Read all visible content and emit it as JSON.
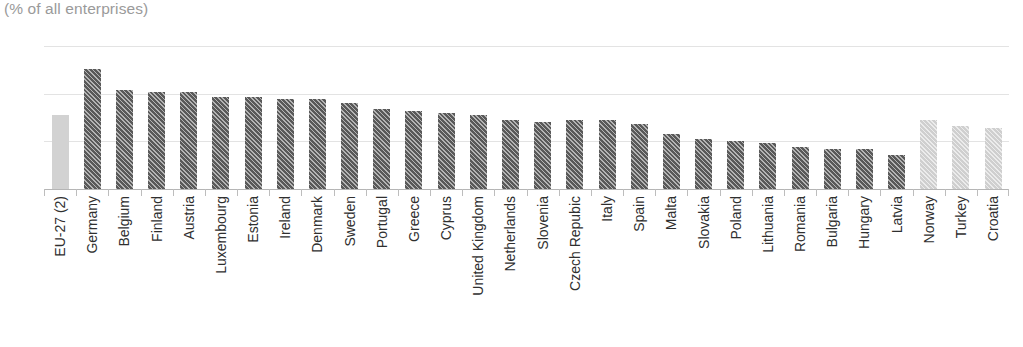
{
  "chart_data": {
    "type": "bar",
    "title": "",
    "subtitle": "(% of all enterprises)",
    "xlabel": "",
    "ylabel": "",
    "ylim": [
      0,
      75
    ],
    "yticks": [
      0,
      25,
      50,
      75
    ],
    "grid": true,
    "legend": "none",
    "categories": [
      "EU-27 (2)",
      "Germany",
      "Belgium",
      "Finland",
      "Austria",
      "Luxembourg",
      "Estonia",
      "Ireland",
      "Denmark",
      "Sweden",
      "Portugal",
      "Greece",
      "Cyprus",
      "United Kingdom",
      "Netherlands",
      "Slovenia",
      "Czech Repubic",
      "Italy",
      "Spain",
      "Malta",
      "Slovakia",
      "Poland",
      "Lithuania",
      "Romania",
      "Bulgaria",
      "Hungary",
      "Latvia",
      "Norway",
      "Turkey",
      "Croatia"
    ],
    "values": [
      39,
      63,
      52,
      51,
      51,
      48,
      48,
      47,
      47,
      45,
      42,
      41,
      40,
      39,
      36,
      35,
      36,
      36,
      34,
      29,
      26,
      25,
      24,
      22,
      21,
      21,
      18,
      36,
      33,
      32
    ],
    "series_styles": [
      "aggregate",
      "member",
      "member",
      "member",
      "member",
      "member",
      "member",
      "member",
      "member",
      "member",
      "member",
      "member",
      "member",
      "member",
      "member",
      "member",
      "member",
      "member",
      "member",
      "member",
      "member",
      "member",
      "member",
      "member",
      "member",
      "member",
      "member",
      "nonmember",
      "nonmember",
      "nonmember"
    ]
  },
  "colors": {
    "aggregate": "#d2d2d2",
    "member": "#595959",
    "nonmember": "#cfcfcf",
    "gridline": "#e3e3e3",
    "axis": "#b5b5b5",
    "text": "#2f2f2f",
    "subtitle": "#9a9a9a"
  }
}
